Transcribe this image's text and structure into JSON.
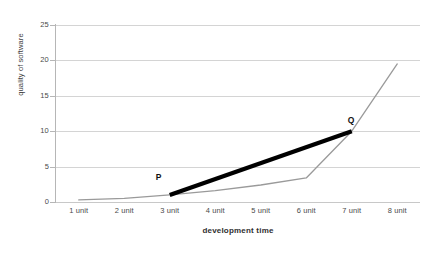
{
  "chart_data": {
    "type": "line",
    "title": "",
    "xlabel": "development time",
    "ylabel": "quality of software",
    "categories": [
      "1 unit",
      "2 unit",
      "3 unit",
      "4 unit",
      "5 unit",
      "6 unit",
      "7 unit",
      "8 unit"
    ],
    "yticks": [
      0,
      5,
      10,
      15,
      20,
      25
    ],
    "ylim": [
      0,
      25
    ],
    "grid": true,
    "legend": "none",
    "series": [
      {
        "name": "quality curve",
        "type": "line",
        "color": "#9a9a9a",
        "x": [
          1,
          2,
          3,
          4,
          5,
          6,
          7,
          8
        ],
        "values": [
          0.3,
          0.5,
          1.0,
          1.6,
          2.4,
          3.4,
          10.0,
          19.5
        ]
      },
      {
        "name": "secant PQ",
        "type": "line",
        "color": "#000000",
        "x": [
          3,
          7
        ],
        "values": [
          1.0,
          10.0
        ]
      }
    ],
    "annotations": [
      {
        "label": "P",
        "x": 3,
        "y": 1.0
      },
      {
        "label": "Q",
        "x": 7,
        "y": 10.0
      }
    ]
  },
  "colors": {
    "curve": "#9a9a9a",
    "secant": "#000000",
    "grid": "#d4d4d4",
    "axis": "#b6b6b6",
    "background": "#ffffff",
    "text": "#3f3f3f"
  }
}
